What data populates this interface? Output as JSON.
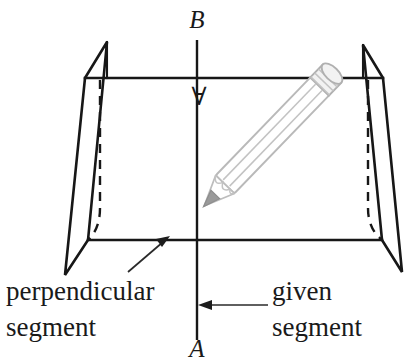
{
  "figure": {
    "background_color": "#ffffff",
    "ink_color": "#171717",
    "pencil_color": "#bdbdbd",
    "graphite_color": "#9a9a9a"
  },
  "point_labels": [
    {
      "id": "b",
      "text": "B",
      "x": 197,
      "y": 28,
      "description": "upper endpoint of given segment"
    },
    {
      "id": "a",
      "text": "A",
      "x": 197,
      "y": 357,
      "description": "lower endpoint of given segment"
    },
    {
      "id": "perpendicular-mark",
      "text": "∀",
      "x": 199,
      "y": 105,
      "description": "inverted A mark below plane intersection"
    }
  ],
  "callouts": [
    {
      "id": "perpendicular-segment",
      "line1": "perpendicular",
      "line2": "segment",
      "x": 6,
      "y_line1": 300,
      "y_line2": 336,
      "arrow_from": [
        128,
        272
      ],
      "arrow_to": [
        168,
        238
      ]
    },
    {
      "id": "given-segment",
      "line1": "given",
      "line2": "segment",
      "x": 272,
      "y_line1": 300,
      "y_line2": 336,
      "arrow_from": [
        268,
        305
      ],
      "arrow_to": [
        200,
        305
      ]
    }
  ],
  "geometry": {
    "plane_top_edge": {
      "x1": 85,
      "y1": 78,
      "x2": 383,
      "y2": 78
    },
    "plane_bottom_edge": {
      "x1": 88,
      "y1": 240,
      "x2": 382,
      "y2": 240
    },
    "left_flap": {
      "apex": [
        107,
        42
      ],
      "top": [
        85,
        78
      ],
      "bottom_left": [
        65,
        275
      ],
      "bottom_right": [
        88,
        240
      ]
    },
    "right_flap": {
      "apex": [
        363,
        45
      ],
      "top": [
        383,
        78
      ],
      "bottom_right": [
        402,
        272
      ],
      "bottom_left": [
        382,
        240
      ]
    },
    "hidden_edge_left": {
      "x": 100,
      "y_top": 78,
      "y_bottom": 240
    },
    "hidden_edge_right": {
      "x": 368,
      "y_top": 78,
      "y_bottom": 240
    },
    "given_segment": {
      "x": 197,
      "y_top": 40,
      "y_bottom": 340
    }
  },
  "pencil": {
    "tip": [
      228,
      236
    ],
    "eraser": [
      305,
      48
    ],
    "angle_degrees": 44,
    "has_ferrule_bands": true,
    "band_count": 3
  }
}
